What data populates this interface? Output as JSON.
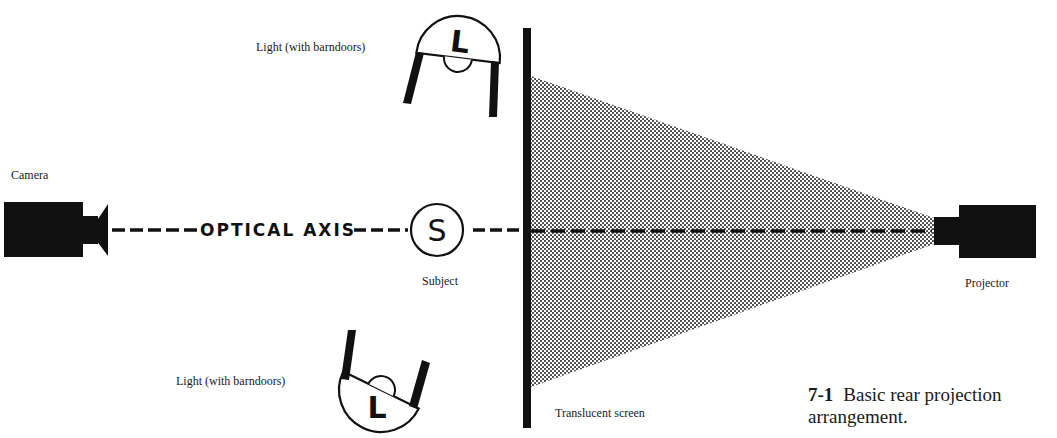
{
  "figure": {
    "number": "7-1",
    "caption_line1": "Basic rear projection",
    "caption_line2": "arrangement."
  },
  "labels": {
    "light_top": "Light (with barndoors)",
    "light_bottom": "Light (with barndoors)",
    "camera": "Camera",
    "optical_axis": "OPTICAL AXIS",
    "subject_letter": "S",
    "subject": "Subject",
    "screen": "Translucent screen",
    "projector": "Projector",
    "light_letter": "L"
  },
  "colors": {
    "ink": "#111111",
    "background": "#ffffff",
    "halftone": "#3a3a3a"
  }
}
